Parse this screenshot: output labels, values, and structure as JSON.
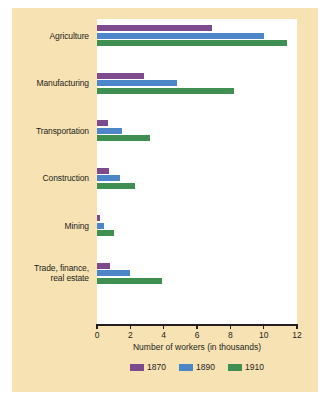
{
  "chart_data": {
    "type": "bar",
    "orientation": "horizontal",
    "title": "",
    "xlabel": "Number of workers (in thousands)",
    "ylabel": "",
    "xlim": [
      0,
      12
    ],
    "xticks": [
      0,
      2,
      4,
      6,
      8,
      10,
      12
    ],
    "xtick_labels": [
      "0",
      "2",
      "4",
      "6",
      "8",
      "10",
      "12"
    ],
    "grid": false,
    "legend_position": "bottom",
    "categories": [
      "Agriculture",
      "Manufacturing",
      "Transportation",
      "Construction",
      "Mining",
      "Trade, finance, real estate"
    ],
    "category_lines": [
      [
        "Agriculture"
      ],
      [
        "Manufacturing"
      ],
      [
        "Transportation"
      ],
      [
        "Construction"
      ],
      [
        "Mining"
      ],
      [
        "Trade, finance,",
        "real estate"
      ]
    ],
    "series": [
      {
        "name": "1870",
        "color": "#7c4a8d",
        "values": [
          6.9,
          2.8,
          0.65,
          0.7,
          0.15,
          0.8
        ]
      },
      {
        "name": "1890",
        "color": "#4c86c9",
        "values": [
          10.0,
          4.8,
          1.5,
          1.4,
          0.4,
          2.0
        ]
      },
      {
        "name": "1910",
        "color": "#3f8f53",
        "values": [
          11.4,
          8.2,
          3.2,
          2.3,
          1.0,
          3.9
        ]
      }
    ]
  },
  "legend": {
    "items": [
      {
        "label": "1870",
        "color": "#7c4a8d"
      },
      {
        "label": "1890",
        "color": "#4c86c9"
      },
      {
        "label": "1910",
        "color": "#3f8f53"
      }
    ]
  },
  "colors": {
    "panel_background": "#f7e2b4",
    "plot_background": "#ffffff",
    "axis": "#231f20",
    "text": "#231f20",
    "series_1870": "#7c4a8d",
    "series_1890": "#4c86c9",
    "series_1910": "#3f8f53"
  }
}
